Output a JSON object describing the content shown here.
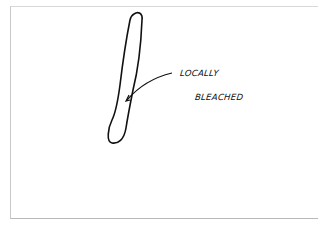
{
  "diagram": {
    "annotation": {
      "line1": "LOCALLY",
      "line2": "BLEACHED"
    },
    "colors": {
      "ink": "#111111",
      "background": "#ffffff",
      "frame": "#c8c8c8"
    }
  }
}
